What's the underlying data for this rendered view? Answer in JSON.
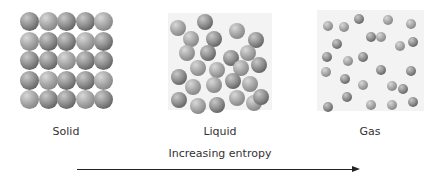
{
  "states": [
    {
      "label": "Solid"
    },
    {
      "label": "Liquid"
    },
    {
      "label": "Gas"
    }
  ],
  "arrow": {
    "label": "Increasing entropy"
  },
  "solid_particles": {
    "rows": 5,
    "cols": 5
  },
  "liquid_particles": [
    [
      177,
      21,
      1
    ],
    [
      204,
      15,
      0
    ],
    [
      190,
      32,
      1
    ],
    [
      213,
      32,
      0
    ],
    [
      236,
      24,
      1
    ],
    [
      255,
      33,
      0
    ],
    [
      186,
      46,
      1
    ],
    [
      207,
      46,
      0
    ],
    [
      230,
      51,
      0
    ],
    [
      247,
      46,
      1
    ],
    [
      197,
      61,
      1
    ],
    [
      216,
      63,
      1
    ],
    [
      240,
      61,
      1
    ],
    [
      258,
      58,
      0
    ],
    [
      178,
      70,
      0
    ],
    [
      192,
      80,
      1
    ],
    [
      213,
      78,
      1
    ],
    [
      232,
      74,
      0
    ],
    [
      249,
      77,
      1
    ],
    [
      178,
      93,
      0
    ],
    [
      197,
      99,
      1
    ],
    [
      216,
      98,
      0
    ],
    [
      236,
      91,
      1
    ],
    [
      253,
      96,
      1
    ],
    [
      260,
      90,
      0
    ]
  ],
  "gas_particles": [
    [
      328,
      22,
      1
    ],
    [
      344,
      23,
      1
    ],
    [
      359,
      15,
      0
    ],
    [
      388,
      16,
      1
    ],
    [
      411,
      20,
      1
    ],
    [
      337,
      40,
      0
    ],
    [
      371,
      33,
      0
    ],
    [
      381,
      33,
      1
    ],
    [
      400,
      42,
      1
    ],
    [
      413,
      38,
      0
    ],
    [
      327,
      53,
      0
    ],
    [
      348,
      57,
      1
    ],
    [
      363,
      53,
      0
    ],
    [
      326,
      68,
      1
    ],
    [
      381,
      66,
      0
    ],
    [
      411,
      67,
      0
    ],
    [
      345,
      75,
      0
    ],
    [
      363,
      81,
      1
    ],
    [
      392,
      82,
      1
    ],
    [
      403,
      85,
      0
    ],
    [
      347,
      93,
      0
    ],
    [
      413,
      98,
      0
    ],
    [
      328,
      103,
      0
    ],
    [
      371,
      101,
      1
    ],
    [
      392,
      101,
      1
    ]
  ]
}
